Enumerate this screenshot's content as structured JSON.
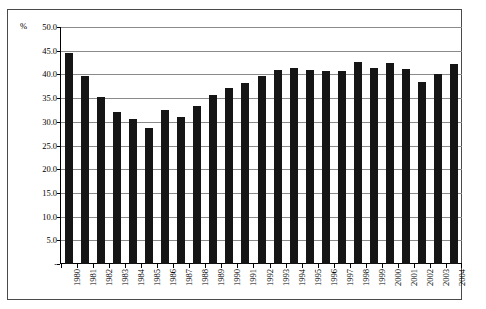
{
  "chart_data": {
    "type": "bar",
    "title": "",
    "subtitle": "",
    "xlabel": "",
    "ylabel": "%",
    "unit_label": "%",
    "ylim": [
      0,
      50
    ],
    "grid": true,
    "legend": "none",
    "y_ticks": [
      "-",
      "5.0",
      "10.0",
      "15.0",
      "20.0",
      "25.0",
      "30.0",
      "35.0",
      "40.0",
      "45.0",
      "50.0"
    ],
    "y_tick_values": [
      0,
      5,
      10,
      15,
      20,
      25,
      30,
      35,
      40,
      45,
      50
    ],
    "categories": [
      "1980",
      "1981",
      "1982",
      "1983",
      "1984",
      "1985",
      "1986",
      "1987",
      "1988",
      "1989",
      "1990",
      "1991",
      "1992",
      "1993",
      "1994",
      "1995",
      "1996",
      "1997",
      "1998",
      "1999",
      "2000",
      "2001",
      "2002",
      "2003",
      "2004"
    ],
    "values": [
      44.5,
      39.7,
      35.2,
      32.0,
      30.6,
      28.8,
      32.4,
      31.1,
      33.3,
      35.7,
      37.1,
      38.2,
      39.6,
      41.0,
      41.3,
      40.9,
      40.8,
      40.8,
      42.6,
      41.4,
      42.4,
      41.2,
      38.4,
      40.1,
      42.1
    ],
    "series": [
      {
        "name": "Series 1",
        "color": "#151515",
        "values": [
          44.5,
          39.7,
          35.2,
          32.0,
          30.6,
          28.8,
          32.4,
          31.1,
          33.3,
          35.7,
          37.1,
          38.2,
          39.6,
          41.0,
          41.3,
          40.9,
          40.8,
          40.8,
          42.6,
          41.4,
          42.4,
          41.2,
          38.4,
          40.1,
          42.1
        ]
      }
    ]
  },
  "colors": {
    "bar": "#151515",
    "grid": "#8a8a8a",
    "axis": "#000000",
    "frame": "#4a4a4a",
    "background": "#ffffff"
  }
}
